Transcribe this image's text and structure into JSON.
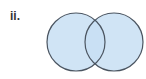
{
  "label": "ii.",
  "diagram": {
    "type": "venn",
    "sets": 2,
    "fill_color": "#c8dff3",
    "stroke_color": "#4b5561",
    "circles": [
      {
        "cx": 76,
        "cy": 42,
        "r": 29
      },
      {
        "cx": 114,
        "cy": 42,
        "r": 29
      }
    ]
  }
}
